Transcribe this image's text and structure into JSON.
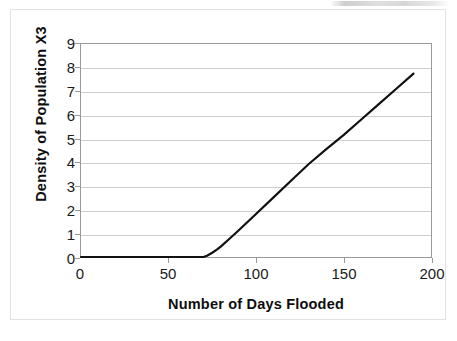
{
  "chart_data": {
    "type": "line",
    "title": "",
    "xlabel": "Number of Days Flooded",
    "ylabel": "Density of Population X3",
    "xlim": [
      0,
      200
    ],
    "ylim": [
      0,
      9
    ],
    "xticks": [
      0,
      50,
      100,
      150,
      200
    ],
    "yticks": [
      0,
      1,
      2,
      3,
      4,
      5,
      6,
      7,
      8,
      9
    ],
    "grid": "horizontal",
    "legend": "none",
    "series": [
      {
        "name": "Density of Population X3",
        "color": "#111111",
        "x": [
          0,
          10,
          20,
          30,
          40,
          50,
          60,
          70,
          72,
          75,
          78,
          80,
          85,
          90,
          95,
          100,
          110,
          120,
          130,
          140,
          150,
          160,
          170,
          180,
          190
        ],
        "y": [
          0.0,
          0.0,
          0.0,
          0.0,
          0.0,
          0.0,
          0.0,
          0.0,
          0.05,
          0.18,
          0.33,
          0.45,
          0.78,
          1.12,
          1.47,
          1.82,
          2.52,
          3.22,
          3.92,
          4.55,
          5.15,
          5.8,
          6.45,
          7.1,
          7.75
        ]
      }
    ],
    "annotations": []
  },
  "axes": {
    "y_tick_labels": [
      "9",
      "8",
      "7",
      "6",
      "5",
      "4",
      "3",
      "2",
      "1",
      "0"
    ],
    "x_tick_labels": [
      "0",
      "50",
      "100",
      "150",
      "200"
    ],
    "y_title": "Density of Population X3",
    "x_title": "Number of Days Flooded"
  },
  "style": {
    "line_color": "#111111",
    "grid_color": "#d0d0d0",
    "axis_color": "#9a9a9a",
    "frame_color": "#e2e2e2",
    "background": "#ffffff"
  }
}
